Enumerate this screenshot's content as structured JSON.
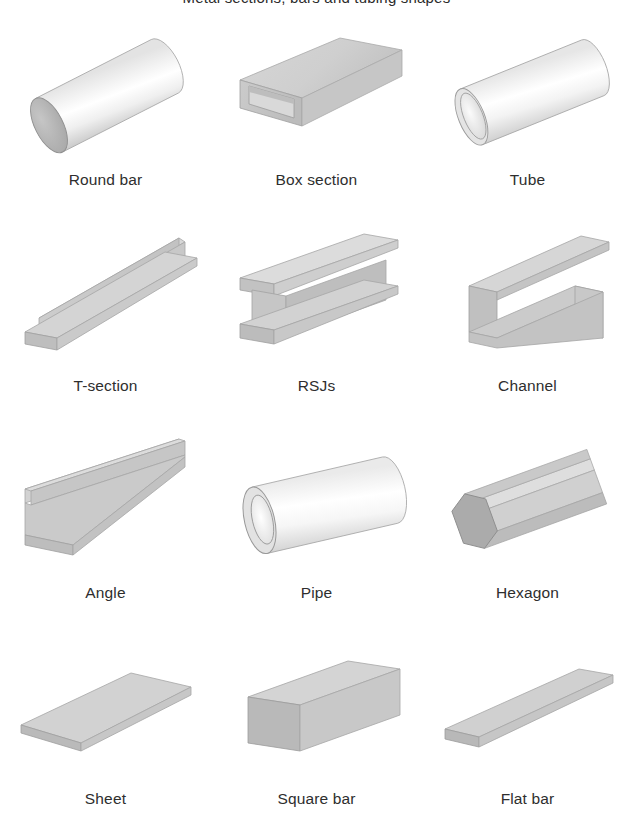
{
  "figure": {
    "title_cut_off": "Metal sections, bars and tubing shapes",
    "background_color": "#ffffff",
    "palette": {
      "light": "#e9e9e9",
      "highlight": "#fafafa",
      "mid": "#cfcfcf",
      "mid_dark": "#bdbdbd",
      "dark": "#ababab",
      "darkest": "#9d9d9d",
      "outline": "#9a9a9a",
      "text": "#2e2e2e"
    },
    "columns": 3,
    "rows": 4,
    "items": [
      {
        "id": "round-bar",
        "label": "Round bar",
        "shape": "solid-cylinder",
        "row": 1,
        "col": 1
      },
      {
        "id": "box-section",
        "label": "Box section",
        "shape": "rectangular-hollow",
        "row": 1,
        "col": 2
      },
      {
        "id": "tube",
        "label": "Tube",
        "shape": "thin-wall-cylinder",
        "row": 1,
        "col": 3
      },
      {
        "id": "t-section",
        "label": "T-section",
        "shape": "tee-beam",
        "row": 2,
        "col": 1
      },
      {
        "id": "rsjs",
        "label": "RSJs",
        "shape": "i-beam",
        "row": 2,
        "col": 2
      },
      {
        "id": "channel",
        "label": "Channel",
        "shape": "u-channel",
        "row": 2,
        "col": 3
      },
      {
        "id": "angle",
        "label": "Angle",
        "shape": "l-angle",
        "row": 3,
        "col": 1
      },
      {
        "id": "pipe",
        "label": "Pipe",
        "shape": "thick-wall-cylinder",
        "row": 3,
        "col": 2
      },
      {
        "id": "hexagon",
        "label": "Hexagon",
        "shape": "hexagonal-bar",
        "row": 3,
        "col": 3
      },
      {
        "id": "sheet",
        "label": "Sheet",
        "shape": "thin-wide-plate",
        "row": 4,
        "col": 1
      },
      {
        "id": "square-bar",
        "label": "Square bar",
        "shape": "solid-square-prism",
        "row": 4,
        "col": 2
      },
      {
        "id": "flat-bar",
        "label": "Flat bar",
        "shape": "thin-narrow-strip",
        "row": 4,
        "col": 3
      }
    ]
  }
}
